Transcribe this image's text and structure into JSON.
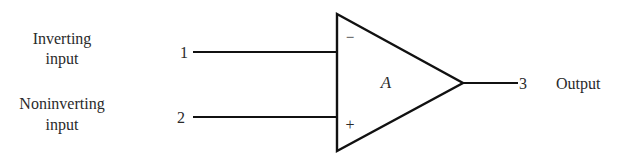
{
  "diagram": {
    "inputs": [
      {
        "pin": "1",
        "label_line1": "Inverting",
        "label_line2": "input",
        "sign": "−"
      },
      {
        "pin": "2",
        "label_line1": "Noninverting",
        "label_line2": "input",
        "sign": "+"
      }
    ],
    "amplifier": {
      "gain_label": "A"
    },
    "output": {
      "pin": "3",
      "label": "Output"
    },
    "colors": {
      "stroke": "#111111",
      "text": "#2a2a2a",
      "background": "#ffffff"
    }
  }
}
